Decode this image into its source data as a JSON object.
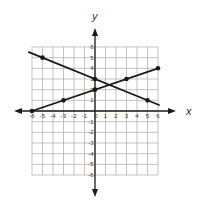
{
  "chart_data": {
    "type": "line",
    "title": "",
    "xlabel": "x",
    "ylabel": "y",
    "xlim": [
      -6,
      6
    ],
    "ylim": [
      -6,
      6
    ],
    "grid": true,
    "x_ticks": [
      "-6",
      "-5",
      "-4",
      "-3",
      "-2",
      "-1",
      "0",
      "1",
      "2",
      "3",
      "4",
      "5",
      "6"
    ],
    "y_ticks": [
      "-6",
      "-5",
      "-4",
      "-3",
      "-2",
      "-1",
      "1",
      "2",
      "3",
      "4",
      "5",
      "6"
    ],
    "series": [
      {
        "name": "line-decreasing",
        "equation": "y = -0.4x + 3",
        "points": [
          [
            -5,
            5
          ],
          [
            0,
            3
          ],
          [
            5,
            1
          ]
        ],
        "extent": [
          [
            -6.3,
            5.52
          ],
          [
            6.1,
            0.56
          ]
        ]
      },
      {
        "name": "line-increasing",
        "equation": "y = x/3 + 2",
        "points": [
          [
            -6,
            0
          ],
          [
            -3,
            1
          ],
          [
            0,
            2
          ],
          [
            3,
            3
          ],
          [
            6,
            4
          ]
        ],
        "extent": [
          [
            -6,
            0
          ],
          [
            6,
            4
          ]
        ]
      }
    ],
    "intersection": [
      1.36,
      2.45
    ]
  },
  "colors": {
    "line": "#1a1a1a",
    "grid": "#aaaaaa",
    "axis": "#1a1a1a"
  }
}
